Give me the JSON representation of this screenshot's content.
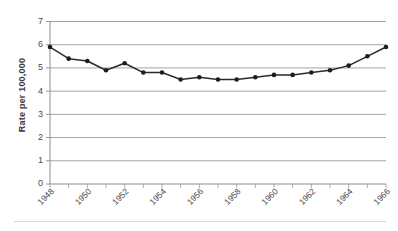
{
  "chart_data": {
    "type": "line",
    "title": "",
    "xlabel": "",
    "ylabel": "Rate per 100,000",
    "ylim": [
      0,
      7
    ],
    "yticks": [
      0,
      1,
      2,
      3,
      4,
      5,
      6,
      7
    ],
    "grid": true,
    "legend": false,
    "legend_position": "none",
    "marker": "filled-circle",
    "x": [
      1948,
      1949,
      1950,
      1951,
      1952,
      1953,
      1954,
      1955,
      1956,
      1957,
      1958,
      1959,
      1960,
      1961,
      1962,
      1963,
      1964,
      1965,
      1966
    ],
    "xtick_labels": [
      "1948",
      "",
      "1950",
      "",
      "1952",
      "",
      "1954",
      "",
      "1956",
      "",
      "1958",
      "",
      "1960",
      "",
      "1962",
      "",
      "1964",
      "",
      "1966"
    ],
    "xtick_labels_shown": [
      "1948",
      "1950",
      "1952",
      "1954",
      "1956",
      "1958",
      "1960",
      "1962",
      "1964",
      "1966"
    ],
    "categories": [
      "1948",
      "1949",
      "1950",
      "1951",
      "1952",
      "1953",
      "1954",
      "1955",
      "1956",
      "1957",
      "1958",
      "1959",
      "1960",
      "1961",
      "1962",
      "1963",
      "1964",
      "1965",
      "1966"
    ],
    "values": [
      5.9,
      5.4,
      5.3,
      4.9,
      5.2,
      4.8,
      4.8,
      4.5,
      4.6,
      4.5,
      4.5,
      4.6,
      4.7,
      4.7,
      4.8,
      4.9,
      5.1,
      5.5,
      5.9
    ],
    "series": [
      {
        "name": "Rate per 100,000",
        "values": [
          5.9,
          5.4,
          5.3,
          4.9,
          5.2,
          4.8,
          4.8,
          4.5,
          4.6,
          4.5,
          4.5,
          4.6,
          4.7,
          4.7,
          4.8,
          4.9,
          5.1,
          5.5,
          5.9
        ]
      }
    ],
    "colors": {
      "line": "#2b2b2b",
      "marker": "#1d1d1d",
      "grid": "#9a9a9a",
      "axis": "#8c8c8c",
      "text": "#4a4a4a",
      "background": "#ffffff"
    }
  }
}
